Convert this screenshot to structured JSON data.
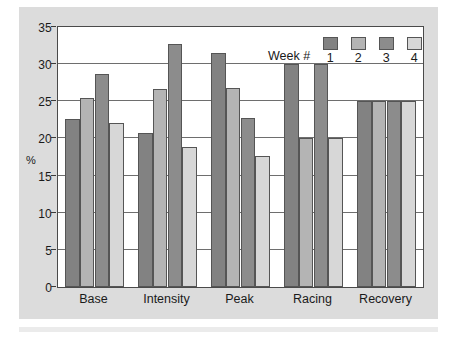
{
  "chart_data": {
    "type": "bar",
    "title": "",
    "xlabel": "",
    "ylabel": "%",
    "ylim": [
      0,
      35
    ],
    "yticks": [
      0,
      5,
      10,
      15,
      20,
      25,
      30,
      35
    ],
    "ytick_labels": [
      "0",
      "5",
      "10",
      "15",
      "20",
      "25",
      "30",
      "35"
    ],
    "grid": true,
    "grid_axis": "y",
    "legend_position": "top-right",
    "legend_title": "Week #",
    "categories": [
      "Base",
      "Intensity",
      "Peak",
      "Racing",
      "Recovery"
    ],
    "series": [
      {
        "name": "1",
        "values": [
          22.6,
          20.8,
          31.5,
          30.0,
          25.0
        ],
        "color": "#828282"
      },
      {
        "name": "2",
        "values": [
          25.4,
          26.7,
          26.8,
          20.0,
          25.0
        ],
        "color": "#b4b4b4"
      },
      {
        "name": "3",
        "values": [
          28.7,
          32.7,
          22.8,
          30.0,
          25.0
        ],
        "color": "#8c8c8c"
      },
      {
        "name": "4",
        "values": [
          22.1,
          18.8,
          17.7,
          20.0,
          25.0
        ],
        "color": "#d7d7d7"
      }
    ]
  },
  "figure": {
    "background_color": "#ffffff",
    "panel_color": "#dcdcdc",
    "plot_background": "#ffffff",
    "frame_color": "#4a4a4a",
    "gridline_color": "#6e6e6e",
    "text_color": "#1a1a1a"
  }
}
